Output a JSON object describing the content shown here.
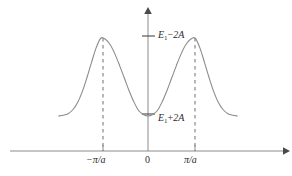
{
  "figure": {
    "kind": "energy-band-diagram",
    "background_color": "#ffffff",
    "stroke_color": "#8c8c8c",
    "text_color": "#2b2b2b"
  },
  "axes": {
    "x_axis_name": "k",
    "y_axis_name": "E",
    "x_arrow": "arrow-right",
    "y_arrow": "arrow-up"
  },
  "labels": {
    "energy_max_symbol": "E",
    "energy_max_subscript": "1",
    "energy_max_operator": "−",
    "energy_max_term": "2A",
    "energy_max_full": "E₁−2A",
    "energy_min_symbol": "E",
    "energy_min_subscript": "1",
    "energy_min_operator": "+",
    "energy_min_term": "2A",
    "energy_min_full": "E₁+2A",
    "tick_negative": "−π/a",
    "tick_zero": "0",
    "tick_positive": "π/a"
  },
  "chart_data": {
    "type": "line",
    "title": "",
    "xlabel": "",
    "ylabel": "",
    "xlim": [
      -2.0,
      2.0
    ],
    "ylim": [
      0,
      1
    ],
    "grid": false,
    "legend": null,
    "x_tick_values": [
      -1,
      0,
      1
    ],
    "x_tick_labels": [
      "−π/a",
      "0",
      "π/a"
    ],
    "y_tick_values": [
      1,
      0
    ],
    "y_tick_labels": [
      "E₁−2A",
      "E₁+2A"
    ],
    "annotations": [
      {
        "text": "E₁−2A",
        "x": 0.08,
        "y": 1.0,
        "role": "band-maximum"
      },
      {
        "text": "E₁+2A",
        "x": 0.08,
        "y": 0.0,
        "role": "band-minimum"
      }
    ],
    "dashed_verticals": [
      -1,
      1
    ],
    "series": [
      {
        "name": "E(k)",
        "x": [
          -2.0,
          -1.9,
          -1.8,
          -1.7,
          -1.6,
          -1.5,
          -1.4,
          -1.3,
          -1.2,
          -1.1,
          -1.0,
          -0.9,
          -0.8,
          -0.7,
          -0.6,
          -0.5,
          -0.4,
          -0.3,
          -0.2,
          -0.1,
          0.0,
          0.1,
          0.2,
          0.3,
          0.4,
          0.5,
          0.6,
          0.7,
          0.8,
          0.9,
          1.0,
          1.1,
          1.2,
          1.3,
          1.4,
          1.5,
          1.6,
          1.7,
          1.8,
          1.9,
          2.0
        ],
        "y": [
          0.0,
          0.0,
          0.01,
          0.03,
          0.08,
          0.17,
          0.31,
          0.49,
          0.69,
          0.88,
          1.0,
          0.98,
          0.91,
          0.79,
          0.64,
          0.48,
          0.32,
          0.18,
          0.07,
          0.02,
          0.0,
          0.02,
          0.07,
          0.18,
          0.32,
          0.48,
          0.64,
          0.79,
          0.91,
          0.98,
          1.0,
          0.88,
          0.69,
          0.49,
          0.31,
          0.17,
          0.08,
          0.03,
          0.01,
          0.0,
          0.0
        ]
      }
    ]
  }
}
